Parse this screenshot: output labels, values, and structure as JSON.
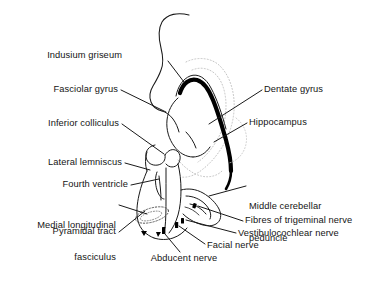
{
  "figure": {
    "type": "anatomical-line-diagram",
    "colors": {
      "background": "#ffffff",
      "outline": "#1a1a1a",
      "hippocampus_fill": "#000000",
      "dotted_outline": "#bdbdbd",
      "leader_line": "#1a1a1a",
      "text": "#141414"
    }
  },
  "labels": {
    "indusium_griseum": "Indusium griseum",
    "fasciolar_gyrus": "Fasciolar gyrus",
    "inferior_colliculus": "Inferior colliculus",
    "lateral_lemniscus": "Lateral lemniscus",
    "fourth_ventricle": "Fourth ventricle",
    "medial_longitudinal_fasciculus_l1": "Medial longitudinal",
    "medial_longitudinal_fasciculus_l2": "fasciculus",
    "pyramidal_tract": "Pyramidal tract",
    "dentate_gyrus": "Dentate gyrus",
    "hippocampus": "Hippocampus",
    "middle_cerebellar_peduncle_l1": "Middle cerebellar",
    "middle_cerebellar_peduncle_l2": "peduncle",
    "fibres_of_trigeminal_nerve": "Fibres of trigeminal nerve",
    "vestibulocochlear_nerve": "Vestibulocochlear nerve",
    "facial_nerve": "Facial nerve",
    "abducent_nerve": "Abducent nerve"
  }
}
